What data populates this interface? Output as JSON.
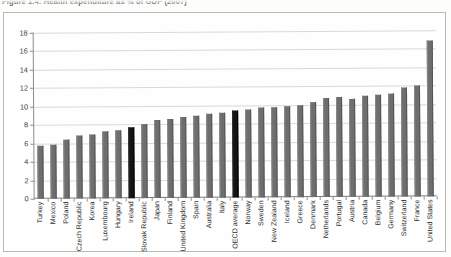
{
  "caption": "Figure 1.4: Health expenditure as % of GDP (2007)",
  "colors": {
    "bar": "#6f6e6e",
    "highlight_bar": "#141414",
    "gridline": "#d9d9d5",
    "axis": "#8d8d8a",
    "frame": "#b9b9b4",
    "page_background": "#fdfdfc"
  },
  "chart_data": {
    "type": "bar",
    "title": "Figure 1.4: Health expenditure as % of GDP (2007)",
    "xlabel": "",
    "ylabel": "",
    "ylim": [
      0,
      18
    ],
    "yticks": [
      0,
      2,
      4,
      6,
      8,
      10,
      12,
      14,
      16,
      18
    ],
    "grid": true,
    "legend": "none",
    "orientation": "vertical",
    "categories": [
      "Turkey",
      "Mexico",
      "Poland",
      "Czech Republic",
      "Korea",
      "Luxembourg",
      "Hungary",
      "Ireland",
      "Slovak Republic",
      "Japan",
      "Finland",
      "United Kingdom",
      "Spain",
      "Australia",
      "Italy",
      "OECD average",
      "Norway",
      "Sweden",
      "New Zealand",
      "Iceland",
      "Greece",
      "Denmark",
      "Netherlands",
      "Portugal",
      "Austria",
      "Canada",
      "Belgium",
      "Germany",
      "Switzerland",
      "France",
      "United States"
    ],
    "values": [
      5.7,
      5.9,
      6.4,
      6.8,
      6.9,
      7.3,
      7.4,
      7.7,
      8.0,
      8.5,
      8.6,
      8.8,
      8.9,
      9.1,
      9.2,
      9.4,
      9.5,
      9.8,
      9.8,
      9.9,
      10.0,
      10.3,
      10.7,
      10.8,
      10.6,
      11.0,
      11.1,
      11.2,
      11.8,
      12.0,
      16.9
    ],
    "highlighted": [
      "Ireland",
      "OECD average"
    ],
    "units": "% of GDP"
  }
}
